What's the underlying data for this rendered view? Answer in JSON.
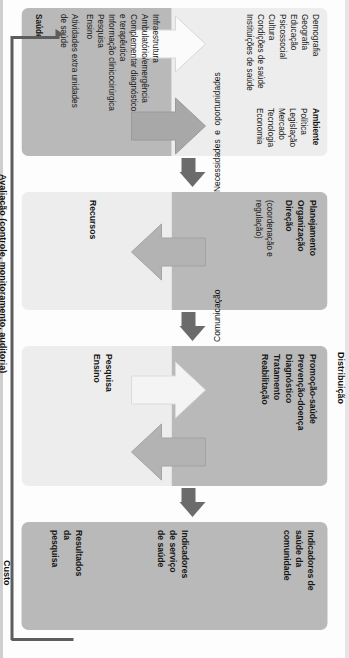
{
  "diagram": {
    "orientation": "rotated-90-cw",
    "colors": {
      "box_dark": "#b9b9b9",
      "box_light": "#ededed",
      "connector": "#6b6b6b",
      "inner_arrow_dark": "#a8a8a8",
      "inner_arrow_light": "#f2f2f2",
      "eval_line": "#5d5d5d",
      "text": "#161616"
    }
  },
  "outside_labels": {
    "distribuicao": "Distribuição",
    "comunicacao": "Comunicação",
    "necessidades": "Necessidades  e  oportunidades",
    "custo": "Custo",
    "avaliacao": "Avaliação (controle, monitoramento, auditoria)"
  },
  "boxes": [
    {
      "id": "entrada",
      "top_section": {
        "header": "Ambiente",
        "header_items": [
          "Política",
          "Legislação",
          "Mercado",
          "Tecnologia",
          "Economia"
        ],
        "left_items": [
          "Demografia",
          "Geografia",
          "Educação",
          "Psicossocial",
          "Cultura",
          "Condições de saúde",
          "Instituições de saúde"
        ]
      },
      "bottom_section": {
        "header": "Saúde",
        "items": [
          "Infraestrutura",
          "Ambulatório/emergência",
          "Complementar diagnóstico",
          "e terapêutica",
          "Informação clinicocirúrgica",
          "Pesquisa",
          "Ensino",
          "Atividades extra unidades",
          "de saúde"
        ]
      }
    },
    {
      "id": "gestao",
      "top_section": {
        "items": [
          "Planejamento",
          "Organização",
          "Direção"
        ],
        "note": [
          "(coordenação e",
          "regulação)"
        ]
      },
      "bottom_section": {
        "items": [
          "Recursos"
        ]
      }
    },
    {
      "id": "processos",
      "top_section": {
        "items": [
          "Promoção-saúde",
          "Prevenção-doença",
          "Diagnóstico",
          "Tratamento",
          "Reabilitação"
        ]
      },
      "bottom_section": {
        "items": [
          "Pesquisa",
          "Ensino"
        ]
      }
    },
    {
      "id": "resultados",
      "items": [
        [
          "Indicadores de",
          "saúde da",
          "comunidade"
        ],
        [
          "Indicadores",
          "de serviço",
          "de saúde"
        ],
        [
          "Resultados",
          "da",
          "pesquisa"
        ]
      ]
    }
  ]
}
